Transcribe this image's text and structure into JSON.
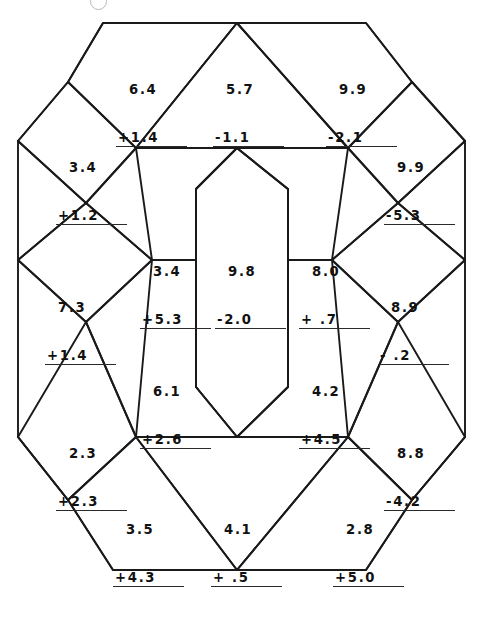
{
  "worksheet": {
    "title": "Decimal addition and subtraction puzzle",
    "page_mark": "partial-circle-mark",
    "ink_color": "#1a1a1a",
    "paper_color": "#ffffff"
  },
  "problems": [
    {
      "id": "p1",
      "region": "top-left-parallelogram",
      "top": "6.4",
      "op": "+",
      "bottom": "1.4",
      "x": 116,
      "y": 50
    },
    {
      "id": "p2",
      "region": "top-center-triangle",
      "top": "5.7",
      "op": "-",
      "bottom": "1.1",
      "x": 213,
      "y": 50
    },
    {
      "id": "p3",
      "region": "top-right-parallelogram",
      "top": "9.9",
      "op": "-",
      "bottom": "2.1",
      "x": 326,
      "y": 50
    },
    {
      "id": "p4",
      "region": "upper-left-diamond",
      "top": "3.4",
      "op": "+",
      "bottom": "1.2",
      "x": 56,
      "y": 128
    },
    {
      "id": "p5",
      "region": "upper-right-diamond",
      "top": "9.9",
      "op": "-",
      "bottom": "5.3",
      "x": 384,
      "y": 128
    },
    {
      "id": "p6",
      "region": "mid-upper-left-trapezoid",
      "top": "3.4",
      "op": "+",
      "bottom": "5.3",
      "x": 140,
      "y": 232
    },
    {
      "id": "p7",
      "region": "center-hexagon",
      "top": "9.8",
      "op": "-",
      "bottom": "2.0",
      "x": 215,
      "y": 232
    },
    {
      "id": "p8",
      "region": "mid-upper-right-trapezoid",
      "top": "8.0",
      "op": "+",
      "bottom": " .7",
      "x": 299,
      "y": 232
    },
    {
      "id": "p9",
      "region": "middle-left-diamond",
      "top": "7.3",
      "op": "+",
      "bottom": "1.4",
      "x": 45,
      "y": 268
    },
    {
      "id": "p10",
      "region": "middle-right-diamond",
      "top": "8.9",
      "op": "-",
      "bottom": " .2",
      "x": 378,
      "y": 268
    },
    {
      "id": "p11",
      "region": "mid-lower-left-trapezoid",
      "top": "6.1",
      "op": "+",
      "bottom": "2.6",
      "x": 140,
      "y": 352
    },
    {
      "id": "p12",
      "region": "mid-lower-right-trapezoid",
      "top": "4.2",
      "op": "+",
      "bottom": "4.5",
      "x": 299,
      "y": 352
    },
    {
      "id": "p13",
      "region": "lower-left-diamond",
      "top": "2.3",
      "op": "+",
      "bottom": "2.3",
      "x": 56,
      "y": 414
    },
    {
      "id": "p14",
      "region": "lower-right-diamond",
      "top": "8.8",
      "op": "-",
      "bottom": "4.2",
      "x": 384,
      "y": 414
    },
    {
      "id": "p15",
      "region": "bottom-left-parallelogram",
      "top": "3.5",
      "op": "+",
      "bottom": "4.3",
      "x": 113,
      "y": 490
    },
    {
      "id": "p16",
      "region": "bottom-center-triangle",
      "top": "4.1",
      "op": "+",
      "bottom": " .5",
      "x": 211,
      "y": 490
    },
    {
      "id": "p17",
      "region": "bottom-right-parallelogram",
      "top": "2.8",
      "op": "+",
      "bottom": "5.0",
      "x": 333,
      "y": 490
    }
  ],
  "geometry": {
    "outline_points": "113,18 240,18 370,18 430,90 460,128 430,167 430,290 460,300 430,345 430,470 460,490 430,530 370,600 240,600 113,600 53,530 23,490 53,448 53,300 23,290 53,250 53,128 23,120 53,82",
    "shape_note": "Interlocking tessellation of triangles, parallelograms, trapezoids and diamonds forming a hexagon with an elongated central hexagon"
  }
}
